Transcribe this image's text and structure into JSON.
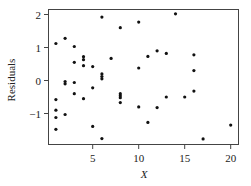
{
  "chart_data": {
    "type": "scatter",
    "title": "",
    "xlabel": "X",
    "ylabel": "Residuals",
    "xlim": [
      0.1,
      20.9
    ],
    "ylim": [
      -1.94,
      2.15
    ],
    "xticks": [
      5,
      10,
      15,
      20
    ],
    "yticks": [
      -1,
      0,
      1,
      2
    ],
    "grid": false,
    "legend": null,
    "series": [
      {
        "name": "residuals",
        "points": [
          {
            "x": 1,
            "y": 1.12
          },
          {
            "x": 1,
            "y": -0.58
          },
          {
            "x": 1,
            "y": -0.9
          },
          {
            "x": 1,
            "y": -1.12
          },
          {
            "x": 1,
            "y": -1.48
          },
          {
            "x": 2,
            "y": 1.28
          },
          {
            "x": 2,
            "y": -0.03
          },
          {
            "x": 2,
            "y": -0.1
          },
          {
            "x": 2,
            "y": -1.03
          },
          {
            "x": 3,
            "y": 1.03
          },
          {
            "x": 3,
            "y": 0.55
          },
          {
            "x": 3,
            "y": -0.06
          },
          {
            "x": 3,
            "y": -0.4
          },
          {
            "x": 4,
            "y": 0.72
          },
          {
            "x": 4,
            "y": 0.63
          },
          {
            "x": 4,
            "y": 0.45
          },
          {
            "x": 4,
            "y": -0.55
          },
          {
            "x": 5,
            "y": 0.42
          },
          {
            "x": 5,
            "y": -0.22
          },
          {
            "x": 5,
            "y": -1.39
          },
          {
            "x": 6,
            "y": 1.92
          },
          {
            "x": 6,
            "y": 0.2
          },
          {
            "x": 6,
            "y": 0.12
          },
          {
            "x": 6,
            "y": 0.05
          },
          {
            "x": 6,
            "y": -1.76
          },
          {
            "x": 7,
            "y": 0.67
          },
          {
            "x": 8,
            "y": 1.6
          },
          {
            "x": 8,
            "y": -0.4
          },
          {
            "x": 8,
            "y": -0.46
          },
          {
            "x": 8,
            "y": -0.52
          },
          {
            "x": 8,
            "y": -0.67
          },
          {
            "x": 10,
            "y": 1.77
          },
          {
            "x": 10,
            "y": 0.38
          },
          {
            "x": 10,
            "y": -0.8
          },
          {
            "x": 11,
            "y": 0.73
          },
          {
            "x": 11,
            "y": -1.27
          },
          {
            "x": 12,
            "y": 0.9
          },
          {
            "x": 12,
            "y": -0.82
          },
          {
            "x": 13,
            "y": 0.82
          },
          {
            "x": 13,
            "y": -0.5
          },
          {
            "x": 14,
            "y": 2.02
          },
          {
            "x": 15,
            "y": -0.5
          },
          {
            "x": 16,
            "y": 0.78
          },
          {
            "x": 16,
            "y": 0.3
          },
          {
            "x": 16,
            "y": -0.32
          },
          {
            "x": 17,
            "y": -1.77
          },
          {
            "x": 20,
            "y": -1.35
          }
        ]
      }
    ]
  },
  "labels": {
    "xlabel": "X",
    "ylabel": "Residuals",
    "xticks": [
      "5",
      "10",
      "15",
      "20"
    ],
    "yticks": [
      "2",
      "1",
      "0",
      "−1"
    ]
  }
}
